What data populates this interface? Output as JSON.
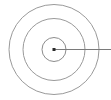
{
  "figure": {
    "background_color": "#ffffff",
    "width": 111,
    "height": 100
  },
  "chart_data": {
    "type": "diagram",
    "subtype": "concentric-circles-radius",
    "title": "",
    "xlabel": "",
    "ylabel": "",
    "grid": false,
    "legend": null,
    "center": {
      "x": 54,
      "y": 49.5
    },
    "circles": [
      {
        "name": "outer-circle",
        "radius": 45,
        "stroke": "#9a9a9a",
        "stroke_width": 1,
        "fill": "none"
      },
      {
        "name": "middle-circle",
        "radius": 31,
        "stroke": "#9a9a9a",
        "stroke_width": 1,
        "fill": "none"
      },
      {
        "name": "inner-circle",
        "radius": 12,
        "stroke": "#8c8c8c",
        "stroke_width": 1,
        "fill": "none"
      }
    ],
    "center_dot": {
      "name": "center-point",
      "shape": "square",
      "size": 3,
      "color": "#2b2b2b"
    },
    "radius_line": {
      "name": "radius-line",
      "x1": 54,
      "y1": 49.5,
      "x2": 111,
      "y2": 49.5,
      "color": "#7a7a7a",
      "stroke_width": 1.2,
      "label": ""
    },
    "annotations": []
  },
  "colors": {
    "stroke": "#9a9a9a",
    "inner_stroke": "#8c8c8c",
    "line": "#7a7a7a",
    "dot": "#2b2b2b",
    "background": "#ffffff"
  }
}
